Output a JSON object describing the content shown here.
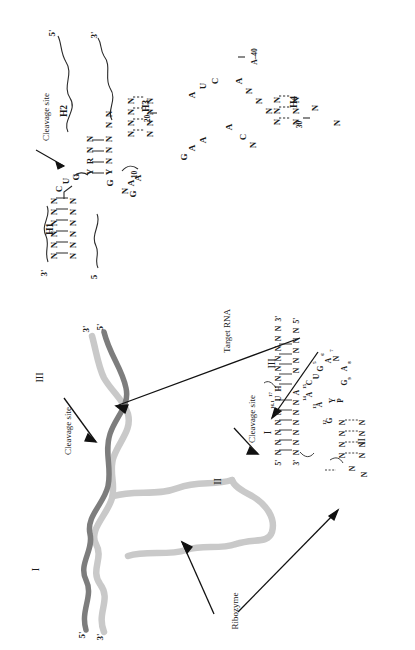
{
  "figure": {
    "type": "hammerhead-ribozyme-diagram",
    "panels": [
      "extended-secondary-structure",
      "tertiary-fold-and-core"
    ]
  },
  "colors": {
    "ribbon_dark": "#7d7d7d",
    "ribbon_light": "#c9c9c9",
    "arrow": "#111111",
    "text": "#1a1a1a",
    "background": "#ffffff"
  },
  "top_panel": {
    "labels": {
      "cleavage_site": "Cleavage site",
      "h1": "H1",
      "h2": "H2",
      "h3": "H3",
      "h4": "H4"
    },
    "termini": [
      {
        "name": "five-prime-top",
        "text": "5'"
      },
      {
        "name": "three-prime-top",
        "text": "3'"
      },
      {
        "name": "three-prime-left",
        "text": "3'"
      },
      {
        "name": "five-prime-left",
        "text": "5"
      }
    ],
    "position_numbers": [
      "10",
      "20",
      "30",
      "40"
    ],
    "h1_strand_upper": [
      "N",
      "N",
      "N",
      "N",
      "N",
      "N"
    ],
    "h1_strand_lower": [
      "N",
      "N",
      "N",
      "N",
      "N",
      "N"
    ],
    "cleavage_nts": [
      "C",
      "U",
      "G"
    ],
    "h2_upper": [
      "Y",
      "R",
      "N",
      "N"
    ],
    "h2_lower": [
      "G",
      "Y",
      "N",
      "N",
      "N",
      "N",
      "N"
    ],
    "core_nts": [
      "N",
      "A",
      "A",
      "G"
    ],
    "h3_pairs": [
      [
        "N",
        "N"
      ],
      [
        "N",
        "N"
      ],
      [
        "N",
        "N"
      ],
      [
        "N",
        "N"
      ]
    ],
    "loop_nts": [
      "G",
      "A",
      "A",
      "A",
      "U",
      "C",
      "A",
      "A",
      "N",
      "N",
      "N",
      "C",
      "N"
    ],
    "a40_label": "A–40",
    "h4_pairs": [
      [
        "N",
        "N"
      ],
      [
        "N",
        "N"
      ],
      [
        "N",
        "N"
      ],
      [
        "N",
        "N"
      ]
    ],
    "h4_tail": [
      "N",
      "N"
    ]
  },
  "bottom_panel": {
    "annotations": [
      {
        "name": "target-rna",
        "text": "Target RNA"
      },
      {
        "name": "cleavage-site-ribbon",
        "text": "Cleavage site"
      },
      {
        "name": "cleavage-site-core",
        "text": "Cleavage site"
      },
      {
        "name": "ribozyme",
        "text": "Ribozyme"
      }
    ],
    "stem_romans": [
      "I",
      "II",
      "III"
    ],
    "ribbon_termini": [
      {
        "name": "five-prime-upper-right",
        "text": "5'"
      },
      {
        "name": "three-prime-upper-right",
        "text": "3'"
      },
      {
        "name": "five-prime-lower-left",
        "text": "5'"
      },
      {
        "name": "three-prime-lower-left",
        "text": "3'"
      }
    ],
    "core": {
      "stem_I_label": "I",
      "stem_III_label": "III",
      "stem_II_label": "II",
      "top_strand": {
        "five_prime": "5'",
        "residues": [
          "N",
          "N",
          "N",
          "N",
          "N"
        ],
        "numbers": [
          "16.1",
          "17"
        ],
        "after_cleavage": [
          "U",
          "H",
          "N",
          "N",
          "N",
          "N",
          "N",
          "N"
        ],
        "three_prime": "3'"
      },
      "bottom_strand": {
        "three_prime": "3'",
        "residues": [
          "N",
          "N",
          "N",
          "N",
          "N",
          "N",
          "A"
        ],
        "right_residues": [
          "N",
          "N",
          "N",
          "N",
          "N"
        ],
        "five_prime": "5'"
      },
      "core_residues": [
        {
          "num": "14",
          "base": "A"
        },
        {
          "num": "15",
          "base": "C"
        },
        {
          "num": "13",
          "base": "A"
        },
        {
          "num": "12",
          "base": "G"
        },
        {
          "base": "U"
        },
        {
          "num": "5",
          "base": "G"
        },
        {
          "num": "6",
          "base": "A"
        },
        {
          "num": "7",
          "base": "N"
        },
        {
          "num": "8",
          "base": "A"
        },
        {
          "num": "9",
          "base": "G"
        },
        {
          "base": "Y"
        },
        {
          "base": "P"
        }
      ],
      "stem_II_pairs": [
        [
          "N",
          "N"
        ],
        [
          "N",
          "N"
        ],
        [
          "N",
          "N"
        ],
        [
          "N",
          "N"
        ]
      ],
      "stem_II_loop": [
        "N",
        "N"
      ]
    }
  }
}
